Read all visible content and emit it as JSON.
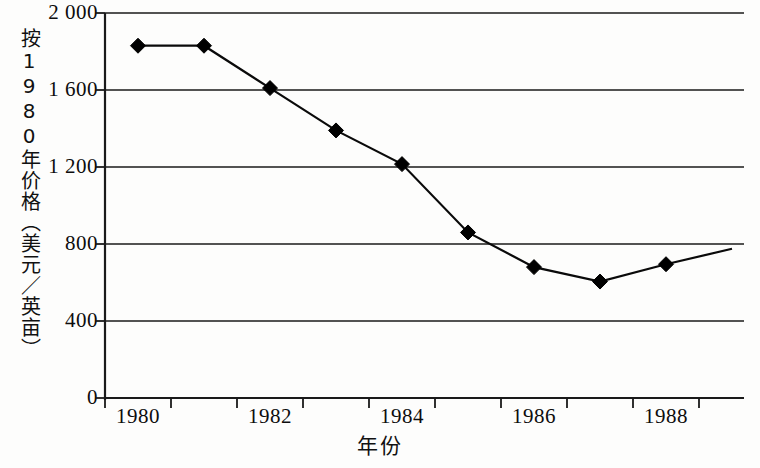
{
  "chart_data": {
    "type": "line",
    "title": "",
    "xlabel": "年份",
    "ylabel": "按1980年价格（美元／英亩）",
    "xlim": [
      1979.5,
      1989.0
    ],
    "ylim": [
      0,
      2000
    ],
    "grid": "horizontal",
    "legend": "none",
    "marker": "diamond",
    "x": [
      1980,
      1981,
      1982,
      1983,
      1984,
      1985,
      1986,
      1987,
      1988,
      1989
    ],
    "values": [
      1830,
      1830,
      1610,
      1390,
      1215,
      860,
      680,
      605,
      695,
      775
    ],
    "point_markers": [
      true,
      true,
      true,
      true,
      true,
      true,
      true,
      true,
      true,
      false
    ],
    "x_tick_labels": [
      "1980",
      "1982",
      "1984",
      "1986",
      "1988"
    ],
    "x_tick_values": [
      1980,
      1982,
      1984,
      1986,
      1988
    ],
    "x_minor_tick_values": [
      1979.5,
      1980.5,
      1981.5,
      1982.5,
      1983.5,
      1984.5,
      1985.5,
      1986.5,
      1987.5,
      1988.5
    ],
    "y_tick_labels": [
      "0",
      "400",
      "800",
      "1 200",
      "1 600",
      "2 000"
    ],
    "y_tick_values": [
      0,
      400,
      800,
      1200,
      1600,
      2000
    ],
    "colors": {
      "line": "#0a0a0a",
      "marker": "#000000",
      "grid": "#1a1a1a",
      "axis": "#1a1a1a",
      "background": "#fdfdfc",
      "text": "#0d0d0d"
    }
  },
  "axis": {
    "y_title": "按1980年价格（美元／英亩）",
    "x_title": "年份"
  },
  "y_ticks": [
    {
      "label": "2 000",
      "value": 2000
    },
    {
      "label": "1 600",
      "value": 1600
    },
    {
      "label": "1 200",
      "value": 1200
    },
    {
      "label": "800",
      "value": 800
    },
    {
      "label": "400",
      "value": 400
    },
    {
      "label": "0",
      "value": 0
    }
  ],
  "x_ticks": [
    {
      "label": "1980",
      "value": 1980
    },
    {
      "label": "1982",
      "value": 1982
    },
    {
      "label": "1984",
      "value": 1984
    },
    {
      "label": "1986",
      "value": 1986
    },
    {
      "label": "1988",
      "value": 1988
    }
  ]
}
